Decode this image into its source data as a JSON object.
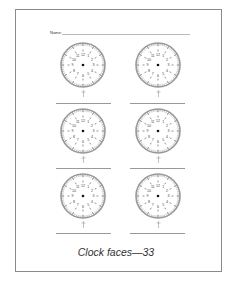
{
  "worksheet": {
    "name_label": "Name:",
    "caption": "Clock faces—33",
    "clock_numbers": [
      "12",
      "1",
      "2",
      "3",
      "4",
      "5",
      "6",
      "7",
      "8",
      "9",
      "10",
      "11"
    ],
    "clocks": [
      {
        "id": 1,
        "cx": 83,
        "cy": 65,
        "line_y": 103,
        "line_x": 56
      },
      {
        "id": 2,
        "cx": 158,
        "cy": 65,
        "line_y": 103,
        "line_x": 130
      },
      {
        "id": 3,
        "cx": 83,
        "cy": 131,
        "line_y": 168,
        "line_x": 56
      },
      {
        "id": 4,
        "cx": 158,
        "cy": 131,
        "line_y": 168,
        "line_x": 130
      },
      {
        "id": 5,
        "cx": 83,
        "cy": 196,
        "line_y": 233,
        "line_x": 56
      },
      {
        "id": 6,
        "cx": 158,
        "cy": 196,
        "line_y": 233,
        "line_x": 130
      }
    ],
    "colors": {
      "rim": "#9a9a9a",
      "ticks": "#777777",
      "numbers": "#444444",
      "center_dot": "#111111",
      "border": "#8a8a8a"
    }
  }
}
